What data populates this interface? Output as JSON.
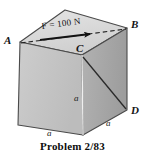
{
  "figure": {
    "caption": "Problem 2/83",
    "force_label": "F = 100 N",
    "vertices": {
      "a_label": "A",
      "b_label": "B",
      "c_label": "C",
      "d_label": "D"
    },
    "dimensions": {
      "edge_vertical": "a",
      "edge_bottom_left": "a",
      "edge_bottom_right": "a"
    },
    "colors": {
      "top_face": "#d9d9d9",
      "left_face": "#c4c4c4",
      "right_face": "#a8a8a8",
      "outline": "#3c3c3c",
      "text": "#111111",
      "background": "#ffffff"
    }
  }
}
